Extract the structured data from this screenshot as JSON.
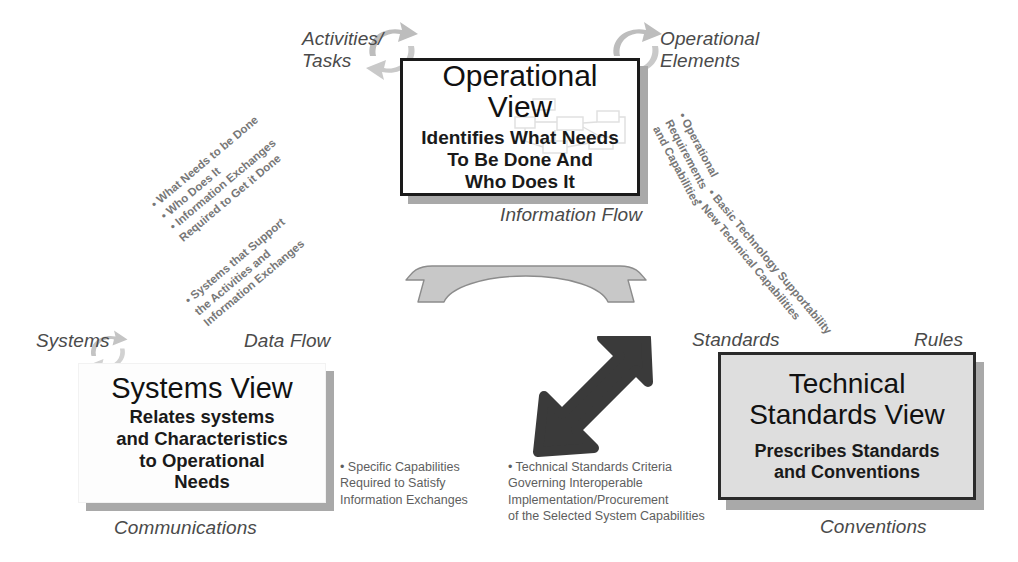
{
  "diagram": {
    "colors": {
      "box_border_dark": "#1a1a1a",
      "tech_box_fill": "#dedede",
      "shadow": "#a9a9a9",
      "italic_label": "#4a4a4a",
      "bullet_text": "#777777",
      "arrow_gray": "#c9c9c9",
      "arrow_dark": "#3a3a3a"
    },
    "operational_view": {
      "title": "Operational\nView",
      "subtitle": "Identifies What Needs\nTo Be Done And\nWho Does It",
      "label_top_left": "Activities/\nTasks",
      "label_top_right": "Operational\nElements",
      "label_bottom": "Information Flow"
    },
    "systems_view": {
      "title": "Systems View",
      "subtitle": "Relates systems\nand Characteristics\nto Operational\nNeeds",
      "label_top_left": "Systems",
      "label_top_right": "Data Flow",
      "label_bottom": "Communications"
    },
    "technical_standards_view": {
      "title": "Technical\nStandards View",
      "subtitle": "Prescribes Standards\nand Conventions",
      "label_top_left": "Standards",
      "label_top_right": "Rules",
      "label_bottom": "Conventions"
    },
    "annotations": {
      "left_upper": "• What Needs to be Done\n  • Who Does It\n   • Information Exchanges\n      Required to Get it Done",
      "left_lower": "• Systems that Support\n   the Activities and\n   Information Exchanges",
      "right_upper": "• Operational\n  Requirements\n  and Capabilities",
      "right_lower": "• Basic Technology Supportability\n• New Technical Capabilities",
      "bottom_left": "• Specific Capabilities\n   Required to Satisfy\n   Information Exchanges",
      "bottom_right": "• Technical Standards Criteria\n   Governing Interoperable\n   Implementation/Procurement\n   of the Selected System Capabilities"
    },
    "icons": {
      "cycle_top_left": "circular-arrows-icon",
      "cycle_top_right": "circular-arrows-icon",
      "cycle_systems": "circular-arrows-icon",
      "horizontal_arch_arrow": "double-headed-arch-arrow-icon",
      "diagonal_arrow": "double-headed-diagonal-arrow-icon",
      "network_watermark": "network-flowchart-icon"
    }
  }
}
